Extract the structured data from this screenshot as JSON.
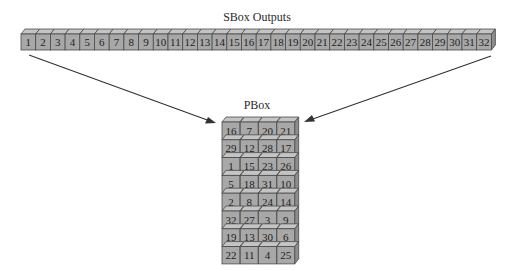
{
  "diagram": {
    "sbox": {
      "title": "SBox Outputs",
      "cells": [
        "1",
        "2",
        "3",
        "4",
        "5",
        "6",
        "7",
        "8",
        "9",
        "10",
        "11",
        "12",
        "13",
        "14",
        "15",
        "16",
        "17",
        "18",
        "19",
        "20",
        "21",
        "22",
        "23",
        "24",
        "25",
        "26",
        "27",
        "28",
        "29",
        "30",
        "31",
        "32"
      ]
    },
    "pbox": {
      "title": "PBox",
      "columns": 4,
      "rows": [
        [
          "16",
          "7",
          "20",
          "21"
        ],
        [
          "29",
          "12",
          "28",
          "17"
        ],
        [
          "1",
          "15",
          "23",
          "26"
        ],
        [
          "5",
          "18",
          "31",
          "10"
        ],
        [
          "2",
          "8",
          "24",
          "14"
        ],
        [
          "32",
          "27",
          "3",
          "9"
        ],
        [
          "19",
          "13",
          "30",
          "6"
        ],
        [
          "22",
          "11",
          "4",
          "25"
        ]
      ]
    },
    "arrows": [
      {
        "from": "sbox-left-end",
        "to": "pbox-top-left"
      },
      {
        "from": "sbox-right-end",
        "to": "pbox-top-right"
      }
    ],
    "colors": {
      "cell_front": "#a8a8a8",
      "cell_top": "#c4c4c4",
      "cell_side": "#8c8c8c",
      "outline": "#4a4a4a",
      "arrow": "#333333"
    }
  }
}
